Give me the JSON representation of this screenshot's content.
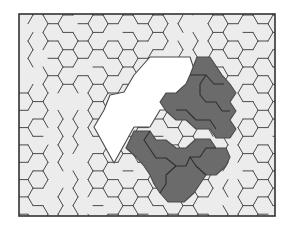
{
  "diagram": {
    "type": "hexagonal-tiling",
    "frame": {
      "x": 19,
      "y": 14,
      "width": 256,
      "height": 202
    },
    "colors": {
      "background": "#ffffff",
      "tile_fill": "#ececec",
      "white_region": "#ffffff",
      "dark_region": "#6b6b6b",
      "edge": "#4a4a4a",
      "frame": "#333333"
    },
    "hex": {
      "size": 10,
      "origin_x": 203,
      "origin_y": 67
    }
  },
  "regions": {
    "white": [
      [
        [
          150,
          57
        ],
        [
          190,
          57
        ],
        [
          196,
          75
        ],
        [
          186,
          92
        ],
        [
          176,
          110
        ],
        [
          160,
          110
        ],
        [
          150,
          127
        ],
        [
          134,
          127
        ],
        [
          124,
          145
        ],
        [
          114,
          163
        ],
        [
          104,
          145
        ],
        [
          94,
          127
        ],
        [
          104,
          110
        ],
        [
          110,
          95
        ],
        [
          124,
          92
        ],
        [
          134,
          75
        ]
      ]
    ],
    "dark_upper": [
      [
        [
          197,
          57
        ],
        [
          210,
          57
        ],
        [
          216,
          66
        ],
        [
          222,
          75
        ],
        [
          230,
          84
        ],
        [
          236,
          93
        ],
        [
          230,
          102
        ],
        [
          236,
          111
        ],
        [
          230,
          120
        ],
        [
          236,
          129
        ],
        [
          230,
          138
        ],
        [
          216,
          138
        ],
        [
          210,
          129
        ],
        [
          196,
          129
        ],
        [
          186,
          120
        ],
        [
          176,
          120
        ],
        [
          166,
          111
        ],
        [
          160,
          102
        ],
        [
          166,
          93
        ],
        [
          176,
          93
        ],
        [
          186,
          84
        ],
        [
          190,
          75
        ]
      ]
    ],
    "dark_lower": [
      [
        [
          134,
          131
        ],
        [
          150,
          131
        ],
        [
          156,
          140
        ],
        [
          166,
          140
        ],
        [
          176,
          148
        ],
        [
          186,
          148
        ],
        [
          196,
          139
        ],
        [
          210,
          139
        ],
        [
          216,
          148
        ],
        [
          226,
          148
        ],
        [
          230,
          157
        ],
        [
          226,
          166
        ],
        [
          216,
          175
        ],
        [
          206,
          175
        ],
        [
          200,
          184
        ],
        [
          194,
          193
        ],
        [
          184,
          202
        ],
        [
          168,
          202
        ],
        [
          160,
          193
        ],
        [
          154,
          184
        ],
        [
          150,
          175
        ],
        [
          144,
          166
        ],
        [
          136,
          157
        ],
        [
          126,
          148
        ]
      ]
    ]
  },
  "inner_edges": {
    "dark_upper": [
      [
        [
          190,
          75
        ],
        [
          206,
          75
        ],
        [
          214,
          84
        ],
        [
          224,
          84
        ]
      ],
      [
        [
          206,
          75
        ],
        [
          200,
          84
        ],
        [
          200,
          95
        ],
        [
          206,
          102
        ],
        [
          216,
          102
        ],
        [
          222,
          111
        ],
        [
          230,
          111
        ]
      ],
      [
        [
          176,
          110
        ],
        [
          186,
          110
        ],
        [
          196,
          120
        ],
        [
          210,
          120
        ],
        [
          216,
          129
        ]
      ]
    ],
    "dark_lower": [
      [
        [
          150,
          131
        ],
        [
          144,
          140
        ],
        [
          150,
          149
        ],
        [
          156,
          158
        ],
        [
          166,
          158
        ],
        [
          176,
          166
        ],
        [
          186,
          166
        ],
        [
          190,
          157
        ],
        [
          200,
          157
        ],
        [
          206,
          148
        ],
        [
          216,
          148
        ]
      ],
      [
        [
          176,
          166
        ],
        [
          166,
          175
        ],
        [
          166,
          184
        ],
        [
          160,
          193
        ]
      ],
      [
        [
          190,
          157
        ],
        [
          196,
          166
        ],
        [
          206,
          175
        ]
      ]
    ]
  }
}
